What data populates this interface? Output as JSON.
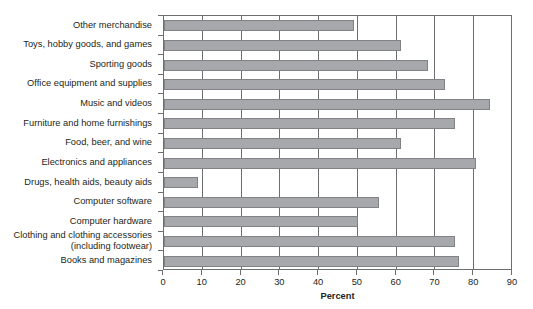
{
  "chart_data": {
    "type": "bar",
    "orientation": "horizontal",
    "title": "",
    "subtitle": "",
    "xlabel": "Percent",
    "ylabel": "",
    "xlim": [
      0,
      90
    ],
    "xticks": [
      0,
      10,
      20,
      30,
      40,
      50,
      60,
      70,
      80,
      90
    ],
    "xtick_labels": [
      "0",
      "10",
      "20",
      "30",
      "40",
      "50",
      "60",
      "70",
      "80",
      "90"
    ],
    "grid": "vertical",
    "legend": "none",
    "bar_color": "#a6a8ab",
    "bar_edge_color": "#808285",
    "axis_color": "#6d6e71",
    "categories": [
      "Other merchandise",
      "Toys, hobby goods, and games",
      "Sporting goods",
      "Office equipment and supplies",
      "Music and videos",
      "Furniture and home furnishings",
      "Food, beer, and wine",
      "Electronics and appliances",
      "Drugs, health aids, beauty aids",
      "Computer software",
      "Computer hardware",
      "Clothing and clothing accessories (including footwear)",
      "Books and magazines"
    ],
    "values": [
      49,
      61,
      68,
      72.5,
      84,
      75,
      61,
      80.5,
      8.8,
      55.5,
      50,
      75,
      76
    ]
  },
  "axis": {
    "x_title": "Percent"
  }
}
